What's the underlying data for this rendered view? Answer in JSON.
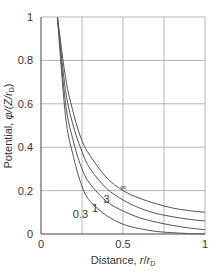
{
  "chart_data": {
    "type": "line",
    "title": "",
    "xlabel": "Distance, r/r_D",
    "ylabel": "Potential, φ/(Z/r_D)",
    "xlim": [
      0,
      1
    ],
    "ylim": [
      0,
      1
    ],
    "grid": true,
    "x_ticks": [
      "0",
      "0.5",
      "1"
    ],
    "x_gridlines": [
      0.25,
      0.5,
      0.75
    ],
    "y_ticks": [
      "0",
      "0.2",
      "0.4",
      "0.6",
      "0.8",
      "1"
    ],
    "legend": "none (curves labeled inline)",
    "x": [
      0.1,
      0.15,
      0.2,
      0.25,
      0.3,
      0.4,
      0.5,
      0.6,
      0.7,
      0.8,
      0.9,
      1.0
    ],
    "series": [
      {
        "name": "∞",
        "values": [
          1.0,
          0.72,
          0.55,
          0.43,
          0.36,
          0.26,
          0.2,
          0.165,
          0.14,
          0.12,
          0.108,
          0.1
        ]
      },
      {
        "name": "3",
        "values": [
          1.0,
          0.66,
          0.49,
          0.38,
          0.3,
          0.21,
          0.157,
          0.12,
          0.095,
          0.08,
          0.068,
          0.06
        ]
      },
      {
        "name": "1",
        "values": [
          1.0,
          0.6,
          0.42,
          0.3,
          0.23,
          0.15,
          0.106,
          0.075,
          0.055,
          0.04,
          0.028,
          0.02
        ]
      },
      {
        "name": "0.3",
        "values": [
          1.0,
          0.54,
          0.35,
          0.22,
          0.15,
          0.085,
          0.045,
          0.025,
          0.012,
          0.006,
          0.002,
          0.0
        ]
      }
    ],
    "annotations": [
      {
        "text": "∞",
        "x": 0.5,
        "y": 0.22
      },
      {
        "text": "3",
        "x": 0.4,
        "y": 0.16
      },
      {
        "text": "1",
        "x": 0.33,
        "y": 0.12
      },
      {
        "text": "0.3",
        "x": 0.24,
        "y": 0.09
      }
    ]
  },
  "labels": {
    "xlabel_main": "Distance, ",
    "xlabel_r": "r",
    "xlabel_slash": "/",
    "xlabel_rd": "r",
    "xlabel_sub": "D",
    "ylabel_main": "Potential, ",
    "ylabel_phi": "φ/(Z/",
    "ylabel_r": "r",
    "ylabel_sub": "D",
    "ylabel_close": ")"
  },
  "colors": {
    "curve": "#555555",
    "grid": "#b5b5b5",
    "axis": "#444444",
    "text": "#333333"
  }
}
